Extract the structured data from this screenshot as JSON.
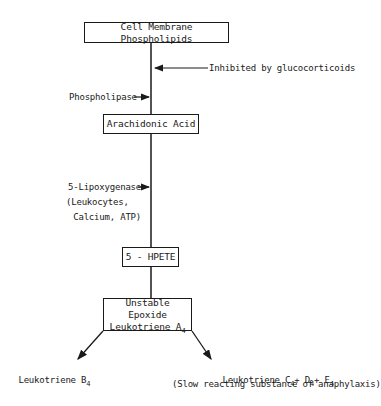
{
  "diagram": {
    "nodes": {
      "cell_membrane": {
        "label": "Cell Membrane Phospholipids"
      },
      "arachidonic_acid": {
        "label": "Arachidonic Acid"
      },
      "hpete": {
        "label": "5 - HPETE"
      },
      "lta4": {
        "line1": "Unstable Epoxide",
        "line2": "Leukotriene A",
        "line2_sub": "4"
      },
      "ltb4": {
        "label": "Leukotriene B",
        "sub": "4"
      },
      "ltc4": {
        "label": "Leukotriene C",
        "sub1": "4",
        "plus1": "+ D",
        "sub2": "4",
        "plus2": "+ E",
        "sub3": "4",
        "note": "(Slow reacting substance of anaphylaxis)"
      }
    },
    "annotations": {
      "inhibited": "Inhibited by glucocorticoids",
      "phospholipase": "Phospholipase",
      "lipoxygenase_line1": "5-Lipoxygenase",
      "lipoxygenase_line2": "(Leukocytes,",
      "lipoxygenase_line3": " Calcium, ATP)"
    },
    "colors": {
      "line": "#1a1a1a",
      "background": "#ffffff"
    }
  }
}
